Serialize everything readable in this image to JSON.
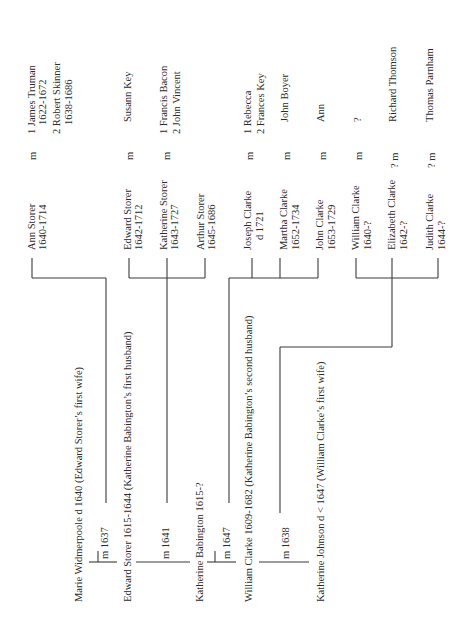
{
  "document": {
    "type": "family tree (rotated page)",
    "orientation": "text rotated 90° counter-clockwise"
  },
  "generation_1": {
    "people": [
      {
        "name_line": "Marie Widmerpoole  d 1640 (Edward Storer’s first wife)"
      },
      {
        "name_line": "Edward Storer 1615-1644  (Katherine Babington’s first husband)"
      },
      {
        "name_line": "Katherine Babington 1615-?"
      },
      {
        "name_line": "William Clarke 1609-1682 (Katherine Babington’s second husband)"
      },
      {
        "name_line": "Katherine Johnson  d < 1647 (William Clarke’s first wife)"
      }
    ],
    "marriages": [
      {
        "label": "m 1637"
      },
      {
        "label": "m 1641"
      },
      {
        "label": "m 1647"
      },
      {
        "label": "m 1638"
      }
    ]
  },
  "generation_2": {
    "children": [
      {
        "name": "Ann Storer",
        "dates": "1640-1714",
        "marriage": "m",
        "spouses": [
          "1  James Truman",
          "1622-1672",
          "2  Robert Skinner",
          "1638-1686"
        ]
      },
      {
        "name": "Edward Storer",
        "dates": "1642-1712",
        "marriage": "m",
        "spouses": [
          "Susann Key"
        ]
      },
      {
        "name": "Katherine Storer",
        "dates": "1643-1727",
        "marriage": "m",
        "spouses": [
          "1  Francis Bacon",
          "2  John Vincent"
        ]
      },
      {
        "name": "Arthur Storer",
        "dates": "1645-1686",
        "marriage": "",
        "spouses": []
      },
      {
        "name": "Joseph Clarke",
        "dates": "d 1721",
        "marriage": "m",
        "spouses": [
          "1  Rebecca",
          "2  Frances Key"
        ]
      },
      {
        "name": "Martha Clarke",
        "dates": "1652-1734",
        "marriage": "m",
        "spouses": [
          "John Boyer"
        ]
      },
      {
        "name": "John Clarke",
        "dates": "1653-1729",
        "marriage": "m",
        "spouses": [
          "Ann"
        ]
      },
      {
        "name": "William Clarke",
        "dates": "1640-?",
        "marriage": "m",
        "spouses": [
          "?"
        ]
      },
      {
        "name": "Elizabeth Clarke",
        "dates": "1642-?",
        "marriage": "? m",
        "spouses": [
          "Richard Thomson"
        ]
      },
      {
        "name": "Judith Clarke",
        "dates": "1644-?",
        "marriage": "? m",
        "spouses": [
          "Thomas Parnham"
        ]
      }
    ]
  }
}
